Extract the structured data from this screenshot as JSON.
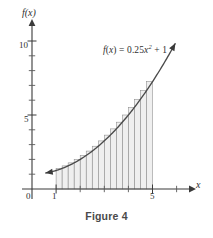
{
  "figure": {
    "caption": "Figure 4",
    "equation_f": "f",
    "equation_paren_open": "(",
    "equation_var": "x",
    "equation_paren_close": ")",
    "equation_equals": " = ",
    "equation_coefficient": "0.25",
    "equation_base": "x",
    "equation_exponent": "2",
    "equation_plus": " + 1",
    "equation_full": "f(x) = 0.25x² + 1"
  },
  "axes": {
    "y_title": "f(x)",
    "x_title": "x",
    "origin_label": "0",
    "y_tick_labels": [
      "5",
      "10"
    ],
    "x_tick_labels": [
      "1",
      "5"
    ],
    "y_major_values": [
      5,
      10
    ],
    "y_minor_values": [
      1,
      2,
      3,
      4,
      6,
      7,
      8,
      9
    ],
    "x_major_values": [
      1,
      5
    ],
    "x_minor_values": [
      2,
      3,
      4,
      6
    ],
    "x_range": [
      -0.5,
      6.6
    ],
    "y_range": [
      -0.8,
      11.2
    ],
    "grid": false
  },
  "chart_data": {
    "type": "area",
    "title": "Figure 4",
    "xlabel": "x",
    "ylabel": "f(x)",
    "xlim": [
      -0.5,
      6.6
    ],
    "ylim": [
      -0.8,
      11.2
    ],
    "grid": false,
    "legend": "none",
    "annotations": [
      {
        "text": "f(x) = 0.25x² + 1",
        "x": 3.6,
        "y": 9.5
      }
    ],
    "function": {
      "expression": "0.25*x^2 + 1",
      "a": 0.25,
      "b": 0,
      "c": 1,
      "domain_drawn": [
        0.55,
        5.95
      ],
      "arrow_start": true,
      "arrow_end": true,
      "x": [
        0.55,
        1.0,
        1.5,
        2.0,
        2.5,
        3.0,
        3.5,
        4.0,
        4.5,
        5.0,
        5.5,
        5.95
      ],
      "y": [
        1.08,
        1.25,
        1.56,
        2.0,
        2.56,
        3.25,
        4.06,
        5.0,
        6.06,
        7.25,
        8.56,
        9.85
      ]
    },
    "riemann": {
      "method": "right-endpoint",
      "interval": [
        1,
        5
      ],
      "n": 16,
      "delta_x": 0.25,
      "right_endpoints": [
        1.25,
        1.5,
        1.75,
        2.0,
        2.25,
        2.5,
        2.75,
        3.0,
        3.25,
        3.5,
        3.75,
        4.0,
        4.25,
        4.5,
        4.75,
        5.0
      ],
      "heights": [
        1.3906,
        1.5625,
        1.7656,
        2.0,
        2.2656,
        2.5625,
        2.8906,
        3.25,
        3.6406,
        4.0625,
        4.5156,
        5.0,
        5.5156,
        6.0625,
        6.6406,
        7.25
      ]
    },
    "series": [
      {
        "name": "f(x) = 0.25x^2 + 1",
        "x": [
          0.55,
          1.0,
          1.5,
          2.0,
          2.5,
          3.0,
          3.5,
          4.0,
          4.5,
          5.0,
          5.5,
          5.95
        ],
        "values": [
          1.08,
          1.25,
          1.56,
          2.0,
          2.56,
          3.25,
          4.06,
          5.0,
          6.06,
          7.25,
          8.56,
          9.85
        ]
      }
    ]
  },
  "colors": {
    "axis": "#3a3a3a",
    "curve": "#4a4a4a",
    "bar_fill": "#e9e9e9",
    "bar_stroke": "#8a8a8a",
    "text": "#2f2f2f",
    "caption": "#4a4a4a",
    "background": "#ffffff"
  }
}
